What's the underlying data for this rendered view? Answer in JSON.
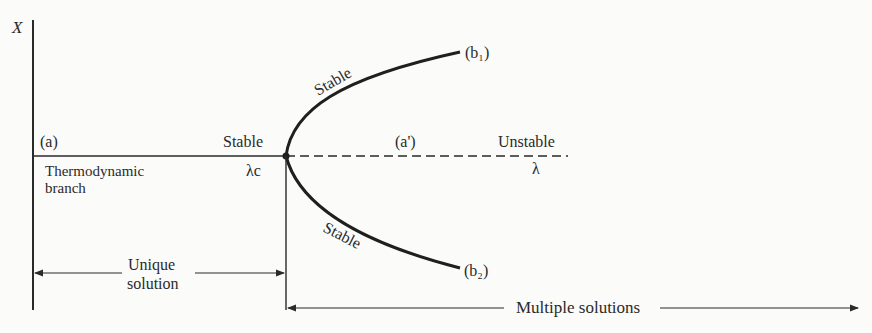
{
  "diagram": {
    "axis": {
      "y_label": "X",
      "x_label": "λ",
      "critical_label": "λc"
    },
    "branches": {
      "a_label": "(a)",
      "a_prime_label": "(a')",
      "b1_label": "(b₁)",
      "b2_label": "(b₂)",
      "thermo_line1": "Thermodynamic",
      "thermo_line2": "branch"
    },
    "stability": {
      "stable_left": "Stable",
      "unstable_right": "Unstable",
      "stable_upper": "Stable",
      "stable_lower": "Stable"
    },
    "regions": {
      "unique_line1": "Unique",
      "unique_line2": "solution",
      "multiple": "Multiple solutions"
    },
    "colors": {
      "ink": "#2a2a2a",
      "background": "#fbfbfa"
    }
  }
}
